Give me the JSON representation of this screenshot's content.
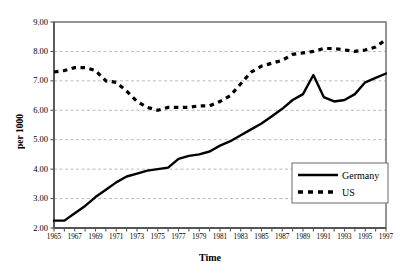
{
  "chart_data": {
    "type": "line",
    "title": "",
    "xlabel": "Time",
    "ylabel": "per 1000",
    "xlim": [
      1965,
      1997
    ],
    "ylim": [
      2.0,
      9.0
    ],
    "ytick_labels": [
      "9.00",
      "8.00",
      "7.00",
      "6.00",
      "5.00",
      "4.00",
      "3.00",
      "2.00"
    ],
    "ytick_values": [
      9.0,
      8.0,
      7.0,
      6.0,
      5.0,
      4.0,
      3.0,
      2.0
    ],
    "xtick_labels": [
      "1965",
      "1967",
      "1969",
      "1971",
      "1973",
      "1975",
      "1977",
      "1979",
      "1981",
      "1983",
      "1985",
      "1987",
      "1989",
      "1991",
      "1993",
      "1995",
      "1997"
    ],
    "xtick_values": [
      1965,
      1967,
      1969,
      1971,
      1973,
      1975,
      1977,
      1979,
      1981,
      1983,
      1985,
      1987,
      1989,
      1991,
      1993,
      1995,
      1997
    ],
    "minor_xticks_every_year": true,
    "grid": "horizontal-dashed",
    "legend_position": "bottom-right",
    "x": [
      1965,
      1966,
      1967,
      1968,
      1969,
      1970,
      1971,
      1972,
      1973,
      1974,
      1975,
      1976,
      1977,
      1978,
      1979,
      1980,
      1981,
      1982,
      1983,
      1984,
      1985,
      1986,
      1987,
      1988,
      1989,
      1990,
      1991,
      1992,
      1993,
      1994,
      1995,
      1996,
      1997
    ],
    "series": [
      {
        "name": "Germany",
        "style": "solid",
        "color": "#000000",
        "values": [
          2.25,
          2.25,
          2.5,
          2.75,
          3.05,
          3.3,
          3.55,
          3.75,
          3.85,
          3.95,
          4.0,
          4.05,
          4.35,
          4.45,
          4.5,
          4.6,
          4.8,
          4.95,
          5.15,
          5.35,
          5.55,
          5.8,
          6.05,
          6.35,
          6.55,
          7.2,
          6.45,
          6.3,
          6.35,
          6.55,
          6.95,
          7.1,
          7.25
        ]
      },
      {
        "name": "US",
        "style": "dashed",
        "color": "#000000",
        "values": [
          7.3,
          7.35,
          7.45,
          7.45,
          7.35,
          7.0,
          6.95,
          6.65,
          6.3,
          6.1,
          6.0,
          6.1,
          6.1,
          6.1,
          6.15,
          6.15,
          6.3,
          6.5,
          6.9,
          7.3,
          7.5,
          7.6,
          7.7,
          7.9,
          7.95,
          8.0,
          8.1,
          8.1,
          8.05,
          8.0,
          8.05,
          8.15,
          8.4
        ]
      }
    ]
  },
  "legend": {
    "items": [
      {
        "label": "Germany",
        "style": "solid"
      },
      {
        "label": "US",
        "style": "dashed"
      }
    ]
  }
}
